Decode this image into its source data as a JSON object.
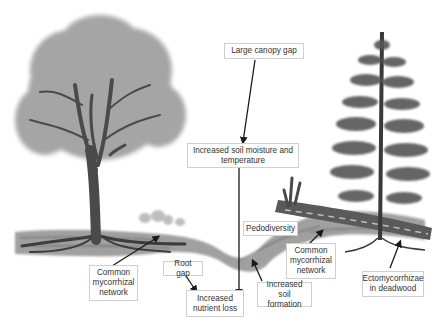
{
  "diagram": {
    "labels": {
      "large_canopy_gap": "Large canopy gap",
      "soil_moisture": "Increased soil moisture and\ntemperature",
      "pedodiversity": "Pedodiversity",
      "common_network_left": "Common\nmycorrhizal\nnetwork",
      "root_gap": "Root gap",
      "nutrient_loss": "Increased\nnutrient loss",
      "soil_formation": "Increased soil\nformation",
      "common_network_right": "Common\nmycorrhizal\nnetwork",
      "ectomycorrhizae": "Ectomycorrhizae\nin deadwood"
    },
    "colors": {
      "background": "#ffffff",
      "label_border": "#cfcfcf",
      "label_text": "#333333",
      "arrow": "#1a1a1a",
      "foliage": "#9a9a9a",
      "trunk": "#3a3a3a",
      "soil": "#8a8a8a"
    }
  }
}
